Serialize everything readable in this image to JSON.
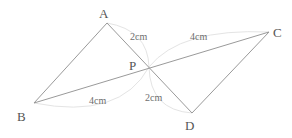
{
  "diagram": {
    "type": "geometry",
    "points": {
      "A": {
        "label": "A",
        "x": 107,
        "y": 23,
        "label_x": 99,
        "label_y": 18
      },
      "B": {
        "label": "B",
        "x": 34,
        "y": 103,
        "label_x": 17,
        "label_y": 121
      },
      "C": {
        "label": "C",
        "x": 269,
        "y": 32,
        "label_x": 273,
        "label_y": 37
      },
      "D": {
        "label": "D",
        "x": 192,
        "y": 113,
        "label_x": 185,
        "label_y": 130
      },
      "P": {
        "label": "P",
        "x": 149,
        "y": 67,
        "label_x": 129,
        "label_y": 70
      }
    },
    "segments": [
      {
        "from": "B",
        "to": "A"
      },
      {
        "from": "A",
        "to": "D"
      },
      {
        "from": "B",
        "to": "C"
      },
      {
        "from": "C",
        "to": "D"
      }
    ],
    "measurements": {
      "AP": {
        "text": "2cm",
        "x": 130,
        "y": 40
      },
      "PC": {
        "text": "4cm",
        "x": 190,
        "y": 40
      },
      "BP": {
        "text": "4cm",
        "x": 89,
        "y": 104
      },
      "PD": {
        "text": "2cm",
        "x": 145,
        "y": 101
      }
    }
  }
}
